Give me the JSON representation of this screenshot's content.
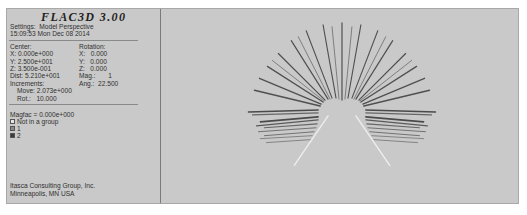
{
  "app": {
    "title": "FLAC3D 3.00"
  },
  "header": {
    "settings": "Settings:  Model Perspective",
    "timestamp": "15:09:53 Mon Dec 08 2014"
  },
  "view": {
    "center_label": "Center:",
    "center": {
      "x": "X: 0.000e+000",
      "y": "Y: 2.500e+001",
      "z": "Z: 3.500e-001"
    },
    "rotation_label": "Rotation:",
    "rotation": {
      "x": "X:   0.000",
      "y": "Y:   0.000",
      "z": "Z:   0.000"
    },
    "dist": "Dist: 5.210e+001",
    "mag": "Mag.:       1",
    "increments_label": "Increments:",
    "ang": "Ang.:  22.500",
    "move": "Move: 2.073e+000",
    "rot": "Rot.:   10.000"
  },
  "legend": {
    "magfac": "Magfac = 0.000e+000",
    "items": [
      {
        "label": "Not in a group",
        "color": "#e6e6e6"
      },
      {
        "label": "1",
        "color": "#8a8a8a"
      },
      {
        "label": "2",
        "color": "#3c3c3c"
      }
    ]
  },
  "footer": {
    "line1": "Itasca Consulting Group, Inc.",
    "line2": "Minneapolis, MN  USA"
  },
  "plot": {
    "background": "#c9c9c9",
    "ray_color": "#505050",
    "light_ray_color": "#eeeeee"
  }
}
